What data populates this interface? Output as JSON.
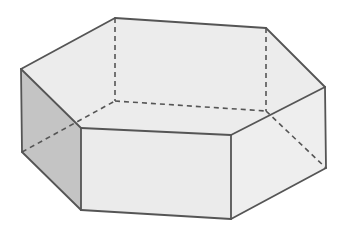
{
  "diagram": {
    "title": "Hexagonal prism",
    "type": "3d-solid-wireframe",
    "colors": {
      "background": "#ffffff",
      "top_face": "#ececec",
      "front_face": "#ebebeb",
      "right_face": "#eeeeee",
      "left_face": "#c4c4c4",
      "edge": "#555555",
      "hidden_edge": "#555555"
    },
    "vertices": {
      "top": {
        "A": [
          21,
          69
        ],
        "B": [
          115,
          18
        ],
        "C": [
          266,
          28
        ],
        "D": [
          325,
          87
        ],
        "E": [
          231,
          135
        ],
        "F": [
          81,
          128
        ]
      },
      "bottom": {
        "A": [
          22,
          152
        ],
        "B": [
          115,
          101
        ],
        "C": [
          266,
          111
        ],
        "D": [
          326,
          168
        ],
        "E": [
          231,
          219
        ],
        "F": [
          81,
          210
        ]
      }
    },
    "faces": [
      {
        "name": "top-face",
        "points": "21,69 115,18 266,28 325,87 231,135 81,128",
        "fill": "#ececec"
      },
      {
        "name": "left-face",
        "points": "21,69 81,128 81,210 22,152",
        "fill": "#c4c4c4"
      },
      {
        "name": "front-face",
        "points": "81,128 231,135 231,219 81,210",
        "fill": "#ebebeb"
      },
      {
        "name": "right-face",
        "points": "231,135 325,87 326,168 231,219",
        "fill": "#eeeeee"
      }
    ],
    "visible_edges": [
      [
        21,
        69,
        115,
        18
      ],
      [
        115,
        18,
        266,
        28
      ],
      [
        266,
        28,
        325,
        87
      ],
      [
        325,
        87,
        231,
        135
      ],
      [
        231,
        135,
        81,
        128
      ],
      [
        81,
        128,
        21,
        69
      ],
      [
        21,
        69,
        22,
        152
      ],
      [
        81,
        128,
        81,
        210
      ],
      [
        231,
        135,
        231,
        219
      ],
      [
        325,
        87,
        326,
        168
      ],
      [
        22,
        152,
        81,
        210
      ],
      [
        81,
        210,
        231,
        219
      ],
      [
        231,
        219,
        326,
        168
      ]
    ],
    "hidden_edges": [
      [
        115,
        18,
        115,
        101
      ],
      [
        266,
        28,
        266,
        111
      ],
      [
        22,
        152,
        115,
        101
      ],
      [
        115,
        101,
        266,
        111
      ],
      [
        266,
        111,
        326,
        168
      ]
    ]
  }
}
